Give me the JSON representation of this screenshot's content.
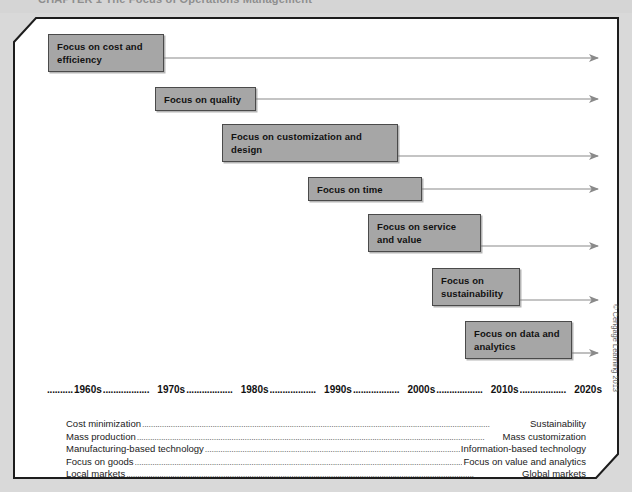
{
  "header": {
    "chapter_title": "CHAPTER 1  The Focus of Operations Management"
  },
  "exhibit": {
    "boxes": [
      {
        "label": "Focus on cost and efficiency",
        "x": 38,
        "y": 20,
        "w": 116,
        "h": 38
      },
      {
        "label": "Focus on quality",
        "x": 145,
        "y": 73,
        "w": 101,
        "h": 24
      },
      {
        "label": "Focus on customization and design",
        "x": 212,
        "y": 110,
        "w": 176,
        "h": 38
      },
      {
        "label": "Focus on time",
        "x": 298,
        "y": 163,
        "w": 114,
        "h": 24
      },
      {
        "label": "Focus on service and value",
        "x": 358,
        "y": 200,
        "w": 113,
        "h": 38
      },
      {
        "label": "Focus on sustainability",
        "x": 422,
        "y": 254,
        "w": 88,
        "h": 38
      },
      {
        "label": "Focus on data and analytics",
        "x": 455,
        "y": 307,
        "w": 107,
        "h": 38
      }
    ],
    "arrows": [
      {
        "x1": 154,
        "y1": 44,
        "x2": 588
      },
      {
        "x1": 246,
        "y1": 85,
        "x2": 588
      },
      {
        "x1": 388,
        "y1": 142,
        "x2": 588
      },
      {
        "x1": 412,
        "y1": 175,
        "x2": 588
      },
      {
        "x1": 471,
        "y1": 232,
        "x2": 588
      },
      {
        "x1": 510,
        "y1": 286,
        "x2": 588
      },
      {
        "x1": 562,
        "y1": 339,
        "x2": 588
      }
    ],
    "decades": [
      "1960s",
      "1970s",
      "1980s",
      "1990s",
      "2000s",
      "2010s",
      "2020s"
    ],
    "decade_leader": "..................",
    "comparison_rows": [
      {
        "left": "Cost minimization",
        "right": "Sustainability"
      },
      {
        "left": "Mass production",
        "right": "Mass customization"
      },
      {
        "left": "Manufacturing-based technology",
        "right": "Information-based technology"
      },
      {
        "left": "Focus on goods",
        "right": "Focus on value and analytics"
      },
      {
        "left": "Local markets",
        "right": "Global markets"
      }
    ],
    "row_leader": "..............................................................................................................................................................",
    "credit": "© Cengage Learning 2013"
  },
  "colors": {
    "page_background": "#d9d9d9",
    "frame_fill": "#ffffff",
    "frame_stroke": "#1d1d1d",
    "box_fill": "#a6a6a6",
    "box_stroke": "#4a4a4a",
    "arrow_stroke": "#8a8a8a",
    "text": "#111111"
  }
}
